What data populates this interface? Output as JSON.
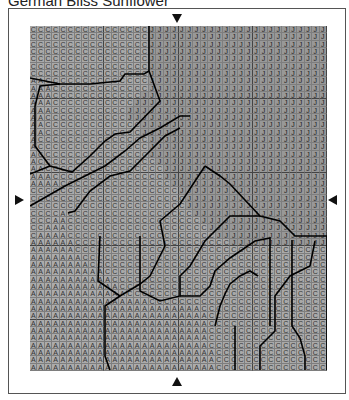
{
  "title": "German Bliss Sunflower",
  "markers": {
    "top": "▼",
    "bottom": "▲",
    "left": "▶",
    "right": "◀"
  },
  "chart_data": {
    "type": "table",
    "title": "German Bliss Sunflower",
    "columns": 40,
    "rows_count": 47,
    "legend": {
      "A": "color A",
      "C": "color C",
      "J": "color J"
    },
    "rows": [
      "CCCCCCCCCCCCCCCCJJJJJJJJJJJJJJJJJJJJJJJJ",
      "CCCCCCCCCCCCCCCCJJJJJJJJJJJJJJJJJJJJJJJJ",
      "CCCCCCCCCCCCCCCCJJJJJJJJJJJJJJJJJJJJJJJJ",
      "CCCCCCCCCCCCCCCCJJJJJJJJJJJJJJJJJJJJJJJJ",
      "CCCCCCCCCCCCCCCCJJJJJJJJJJJJJJJJJJJJJJJJ",
      "CCCCCCCCCCCCCCCCJJJJJJJJJJJJJJJJJJJJJJJJ",
      "CCCCCCCCCCCCCCCCJJJJJJJJJJJJJJJJJJJJJJJJ",
      "AACCCCCCCCCCCCCCJJJJJJJJJJJJJJJJJJJJJJJJ",
      "AAACCCCCCCCCCCCCJJJJJJJJJJJJJJJJJJJJJJJJ",
      "AAACCCCCCCCCCCCJJJJJJJJJJJJJJJJJJJJJJJJJ",
      "AAACCCCCCCCCCCJJJJJJJJJJJJJJJJJJJJJJJJJJ",
      "AAACCCCCCCCCCJJJJJJJJJJJJJJJJJJJJJJJJJJJ",
      "AACCCCCCCCCCCJJJJJJJJJJJJJJJJJJJJJJJJJJJ",
      "AACCCCCCCCCCCCCJJJJJJJJJJJJJJJJJJJJJJJJJ",
      "AACCCCCCCCCCCCCJJJJJJJJJJJJJJJJJJJJJJJJJ",
      "ACCCCCCCCCCCCCCCJJJJJJJJJJJJJJJJJJJJJJJJ",
      "ACCCCCCCCCCCCCCCJJJJJJJJJJJJJJJJJJJJJJJJ",
      "ACCCCCCCCCCCCCCCJJJJJJJJJJJJJJJJJJJJJJJJ",
      "ACCCCCCCCCCCCCCCCJJJJJJJJJJJJJJJJJJJJJJJ",
      "AACCCCCCCCCCCCCCCCJJJJJJJJJJJJJJJJJJJJJJ",
      "AAACCCCCCCCCCCCCCCJJJJJJJJJJJJJJJJJJJJJJ",
      "AAAACCCCCCCCCCCCCCCJJJJJJJJJJJJJJJJJJJJJ",
      "CCCCCCCCCCCCCCCCCCCCJJJJJJJJJJJJJJJJJJJJ",
      "CCCCCCCCCCCCCCCCCCCCCJJJJJJJJJJJJJJJJJJJ",
      "CCCCCCCCCCCCCCCCCCCCCJJJJJJJJJJJJJJJJJJJ",
      "CCCCACCCCCCCCCCCCCCCCCJJJJJJJJJJJJJJJJJJ",
      "CCCAACCCCCCCCCCCCCCCCCCJJJJJJJJJJJJJJJJJ",
      "CCAAACCCCCCCCCCCCCCCCCCCJJJJJJJJJJJJJJJJ",
      "CAAAACCCCCCCCCCCCCCCCCCCCJJJJJJJJJJJJJJJ",
      "AAAAAACCCCCCCCCCCCCCCCCCCCCJJJJJJJJJJJJJ",
      "AAAAAACCCCCCCCCCCCCCCCCCCCCCCCCCCCCCCCCC",
      "AAAAAAACCCCCCCCCCCCCCCCCCCCCCCCCCCCCCCCC",
      "AAAAAAAACCCCCCCCCCCCCCCCCCCCCCCCCCCCCCCC",
      "AAAAAAAAAACCCCCCCCCCCCCCCCCCCCCCCCCCCCCC",
      "AAAAAAAAAAACCCCCCCCCCCCCCCCCCCCCCCCCCCCC",
      "AAAAAAAAAAAACCCCCCCCCCCCCCCCCCCCCCCCCCCC",
      "AAAAAAAAAAAAACCCCCCCCCCCCCCCCCCCCCCCCCCC",
      "AAAAAAAAAAAAAAAACCCCCCCCCCCCCCCCCCCCCCCC",
      "AAAAAAAAAAAAAAAAAAAAAAACCCCCCCCCCCCCCCCC",
      "AAAAAAAAAAAAAAAAAAAAAAAACCCCCCCCCCCCCCCC",
      "AAAAAAAAAAAAAAAAAAAAAAAACCCCCCCCCCCCCCCC",
      "AAAAAAAAAAAAAAAAAAAAAAAACCCCCCCCCCCCCCCC",
      "AAAAAAAAAAAAAAAAAAAAAAAACCCCCCCCCCCCCCCC",
      "AAAAAAAAAAAAAAAAAAAAAAAACCCCCCCCCCCCCCCC",
      "AAAAAAAAAAAAAAAAAAAAAAAAACCCCCCCCCCCCCCC",
      "AAAAAAAAAAAAAAAAAAAAAAAAACCCCCCCCCCCCCCC",
      "AAAAAAAAAAAAAAAAAAAAAAAAACCCCCCCCCCCCCCC"
    ],
    "region_boundaries": [
      "0,136 30,137 36,160 48,160 55,136",
      "119,0 119,60 110,70 95,70 75,90 15,90 0,80"
    ]
  },
  "boundaries": [
    "119,0 119,45",
    "119,45 114,48 95,48 90,55 60,58 30,58 0,52",
    "30,58 10,60 5,80 5,120 20,140 42,146 60,130 75,115 85,108 100,106 130,75 119,45",
    "0,148 20,140",
    "0,180 35,160 75,140 95,125 110,112 130,102 150,90 160,90",
    "175,140 190,150 200,158 230,190 250,195 265,210 297,210",
    "38,187 45,185 60,165 80,150 100,145 120,125 135,110 150,102",
    "70,210 68,255 90,270 110,258 120,250 135,220 130,195 150,178 175,140",
    "80,344 75,330 75,280 90,270",
    "110,210 110,265 130,275 150,270 150,250 160,240 175,215 190,200 200,190 230,190",
    "150,270 170,270 180,260 185,245 200,232 225,215 240,212 240,300",
    "185,300 190,280 195,268 200,258 210,250 220,245 228,250",
    "205,344 205,300",
    "230,344 230,320 245,305 245,300",
    "245,300 245,270 260,250 280,240 285,215",
    "262,214 262,250 262,300 270,312 275,330 275,344",
    "297,210 297,344"
  ]
}
